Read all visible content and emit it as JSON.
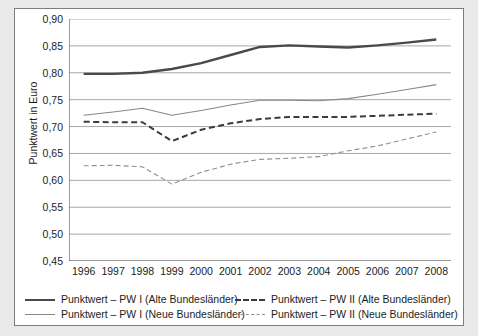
{
  "chart_data": {
    "type": "line",
    "title": "",
    "xlabel": "",
    "ylabel": "Punktwert in Euro",
    "categories": [
      "1996",
      "1997",
      "1998",
      "1999",
      "2000",
      "2001",
      "2002",
      "2003",
      "2004",
      "2005",
      "2006",
      "2007",
      "2008"
    ],
    "ylim": [
      0.45,
      0.9
    ],
    "ytick_step": 0.05,
    "ytick_labels": [
      "0,90",
      "0,85",
      "0,80",
      "0,75",
      "0,70",
      "0,65",
      "0,60",
      "0,55",
      "0,50",
      "0,45"
    ],
    "ytick_values": [
      0.9,
      0.85,
      0.8,
      0.75,
      0.7,
      0.65,
      0.6,
      0.55,
      0.5,
      0.45
    ],
    "grid": true,
    "grid_axis": "y",
    "legend_position": "bottom",
    "series": [
      {
        "name": "Punktwert – PW I (Alte Bundesländer)",
        "style": "solid-thick",
        "color": "#4a4a4a",
        "values": [
          0.798,
          0.798,
          0.8,
          0.807,
          0.818,
          0.833,
          0.848,
          0.851,
          0.849,
          0.847,
          0.851,
          0.856,
          0.862
        ]
      },
      {
        "name": "Punktwert – PW I (Neue Bundesländer)",
        "style": "solid-thin",
        "color": "#878787",
        "values": [
          0.721,
          0.727,
          0.734,
          0.721,
          0.73,
          0.74,
          0.749,
          0.749,
          0.748,
          0.752,
          0.76,
          0.769,
          0.778
        ]
      },
      {
        "name": "Punktwert – PW II (Alte Bundesländer)",
        "style": "dashed-thick",
        "color": "#3c3c3c",
        "values": [
          0.709,
          0.708,
          0.708,
          0.673,
          0.694,
          0.706,
          0.714,
          0.718,
          0.718,
          0.718,
          0.72,
          0.722,
          0.724
        ]
      },
      {
        "name": "Punktwert – PW II (Neue Bundesländer)",
        "style": "dashed-thin",
        "color": "#8f8f8f",
        "values": [
          0.627,
          0.628,
          0.625,
          0.593,
          0.615,
          0.63,
          0.639,
          0.641,
          0.644,
          0.655,
          0.664,
          0.677,
          0.69
        ]
      }
    ]
  },
  "legend": {
    "entries": [
      {
        "label": "Punktwert – PW I (Alte Bundesländer)",
        "style": "solid-thick"
      },
      {
        "label": "Punktwert – PW I (Neue Bundesländer)",
        "style": "solid-thin"
      },
      {
        "label": "Punktwert – PW II (Alte Bundesländer)",
        "style": "dashed-thick"
      },
      {
        "label": "Punktwert – PW II (Neue Bundesländer)",
        "style": "dashed-thin"
      }
    ]
  },
  "colors": {
    "page_background": "#e9e9e9",
    "figure_background": "#ffffff",
    "figure_border": "#7d7d7d",
    "axis": "#5a5a5a",
    "gridline": "#a8a8a8",
    "text": "#1c1c1c"
  }
}
